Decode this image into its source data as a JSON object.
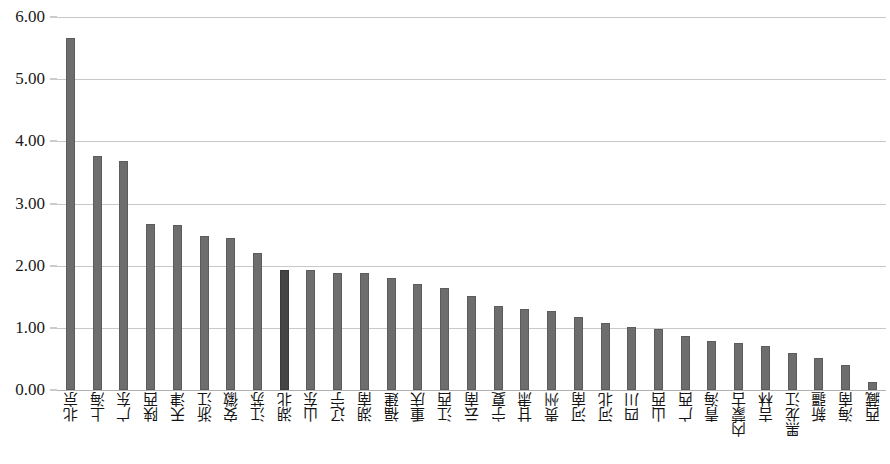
{
  "chart_data": {
    "type": "bar",
    "title": "",
    "subtitle": "",
    "xlabel": "",
    "ylabel": "",
    "ylim": [
      0,
      6
    ],
    "ytick_step": 1,
    "ytick_labels": [
      "0.00",
      "1.00",
      "2.00",
      "3.00",
      "4.00",
      "5.00",
      "6.00"
    ],
    "grid": true,
    "grid_axis": "y",
    "legend": false,
    "legend_position": "none",
    "orientation": "vertical",
    "sorted": "descending",
    "categories": [
      "北京",
      "上海",
      "广东",
      "陕西",
      "天津",
      "浙江",
      "安徽",
      "江苏",
      "湖北",
      "山东",
      "辽宁",
      "湖南",
      "福建",
      "重庆",
      "江西",
      "云南",
      "宁夏",
      "甘肃",
      "贵州",
      "河南",
      "河北",
      "四川",
      "山西",
      "广西",
      "青海",
      "内蒙古",
      "吉林",
      "黑龙江",
      "新疆",
      "海南",
      "西藏"
    ],
    "values": [
      5.66,
      3.77,
      3.68,
      2.67,
      2.66,
      2.48,
      2.44,
      2.21,
      1.93,
      1.93,
      1.88,
      1.88,
      1.8,
      1.7,
      1.64,
      1.52,
      1.35,
      1.31,
      1.27,
      1.18,
      1.07,
      1.01,
      0.98,
      0.87,
      0.79,
      0.76,
      0.71,
      0.59,
      0.52,
      0.4,
      0.13
    ],
    "highlight_index": 8,
    "bar_color": "#6d6d6d",
    "highlight_color": "#454545",
    "gridline_color": "#c8c8c8",
    "background_color": "#ffffff"
  }
}
